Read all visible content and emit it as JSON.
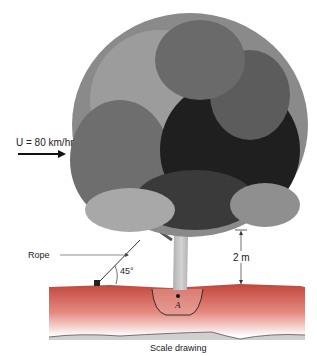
{
  "figure": {
    "wind_label": "U = 80 km/hr",
    "rope_label": "Rope",
    "angle_label": "45°",
    "height_label": "2 m",
    "point_label": "A",
    "caption": "Scale drawing"
  },
  "colors": {
    "ground_top": "#c2453a",
    "ground_bottom": "#ffffff",
    "canopy_light": "#8a8a8a",
    "canopy_mid": "#5e5e5e",
    "canopy_dark": "#1e1e1e",
    "trunk": "#b5b5b5"
  }
}
